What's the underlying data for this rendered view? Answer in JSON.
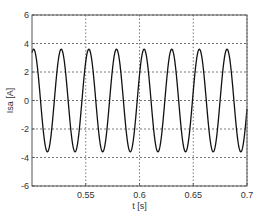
{
  "chart_data": {
    "type": "line",
    "title": "",
    "xlabel": "t [s]",
    "ylabel": "Isa [A]",
    "xlim": [
      0.5,
      0.7
    ],
    "ylim": [
      -6,
      6
    ],
    "xticks": [
      0.55,
      0.6,
      0.65,
      0.7
    ],
    "xtick_labels": [
      "0.55",
      "0.6",
      "0.65",
      "0.7"
    ],
    "yticks": [
      -6,
      -4,
      -2,
      0,
      2,
      4,
      6
    ],
    "ytick_labels": [
      "-6",
      "-4",
      "-2",
      "0",
      "2",
      "4",
      "6"
    ],
    "grid": true,
    "grid_style": "dotted",
    "legend": null,
    "series": [
      {
        "name": "Isa",
        "kind": "sinusoid",
        "amplitude": 3.6,
        "period": 0.0257,
        "first_peak_t": 0.5015,
        "offset": 0,
        "color": "#111111",
        "samples": 800
      }
    ]
  },
  "layout": {
    "plot_left": 32,
    "plot_top": 15,
    "plot_right": 247,
    "plot_bottom": 186
  },
  "colors": {
    "axis": "#555555",
    "grid": "#555555",
    "line": "#111111",
    "background": "#ffffff"
  }
}
